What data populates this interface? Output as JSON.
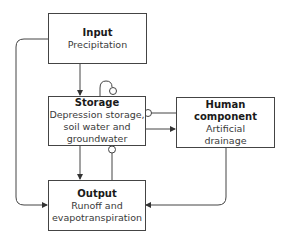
{
  "diagram": {
    "nodes": {
      "input": {
        "title": "Input",
        "lines": [
          "Precipitation"
        ]
      },
      "storage": {
        "title": "Storage",
        "lines": [
          "Depression storage,",
          "soil water and",
          "groundwater"
        ]
      },
      "human": {
        "title": "Human component",
        "lines": [
          "Artificial",
          "drainage"
        ]
      },
      "output": {
        "title": "Output",
        "lines": [
          "Runoff and",
          "evapotranspiration"
        ]
      }
    },
    "edges": [
      {
        "from": "input",
        "to": "storage",
        "type": "arrow"
      },
      {
        "from": "input",
        "to": "output",
        "type": "arrow",
        "route": "left"
      },
      {
        "from": "storage",
        "to": "storage",
        "type": "self-loop-circle"
      },
      {
        "from": "storage",
        "to": "human",
        "type": "arrow"
      },
      {
        "from": "human",
        "to": "storage",
        "type": "circle"
      },
      {
        "from": "storage",
        "to": "output",
        "type": "arrow"
      },
      {
        "from": "output",
        "to": "storage",
        "type": "circle"
      },
      {
        "from": "human",
        "to": "output",
        "type": "arrow",
        "route": "right"
      }
    ],
    "colors": {
      "line": "#444444",
      "text": "#2a2a2a",
      "background": "#ffffff"
    }
  }
}
